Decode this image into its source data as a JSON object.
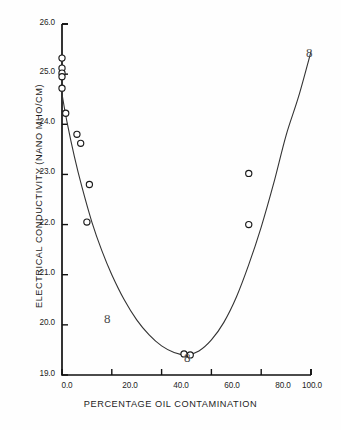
{
  "chart_data": {
    "type": "scatter",
    "title": "",
    "xlabel": "PERCENTAGE OIL CONTAMINATION",
    "ylabel": "ELECTRICAL CONDUCTIVITY (NANO MHO/CM)",
    "xlim": [
      0.0,
      100.0
    ],
    "ylim": [
      19.0,
      26.0
    ],
    "grid": false,
    "legend": null,
    "xticks": [
      0.0,
      20.0,
      40.0,
      60.0,
      80.0,
      100.0
    ],
    "xtick_labels": [
      "0.0",
      "20.0",
      "40.0",
      "60.0",
      "80.0",
      "100.0"
    ],
    "yticks": [
      19.0,
      20.0,
      21.0,
      22.0,
      23.0,
      24.0,
      25.0,
      26.0
    ],
    "ytick_labels": [
      "19.0",
      "20.0",
      "21.0",
      "22.0",
      "23.0",
      "24.0",
      "25.0",
      "26.0"
    ],
    "marker": "open-circle",
    "points": [
      {
        "x": 0.0,
        "y": 25.32
      },
      {
        "x": 0.0,
        "y": 25.12
      },
      {
        "x": 0.0,
        "y": 25.02
      },
      {
        "x": 0.0,
        "y": 24.95
      },
      {
        "x": 0.0,
        "y": 24.72
      },
      {
        "x": 1.5,
        "y": 24.22
      },
      {
        "x": 6.0,
        "y": 23.8
      },
      {
        "x": 7.5,
        "y": 23.62
      },
      {
        "x": 11.0,
        "y": 22.8
      },
      {
        "x": 10.0,
        "y": 22.05
      },
      {
        "x": 49.0,
        "y": 19.42
      },
      {
        "x": 51.5,
        "y": 19.4
      },
      {
        "x": 75.0,
        "y": 23.02
      },
      {
        "x": 75.0,
        "y": 22.0
      }
    ],
    "series": [
      {
        "name": "fitted curve",
        "type": "line",
        "x": [
          0.0,
          2.0,
          5.0,
          8.0,
          12.0,
          16.0,
          20.0,
          25.0,
          30.0,
          35.0,
          40.0,
          45.0,
          50.0,
          55.0,
          60.0,
          65.0,
          70.0,
          75.0,
          80.0,
          85.0,
          90.0,
          95.0,
          100.0
        ],
        "y": [
          24.6,
          24.05,
          23.35,
          22.75,
          22.05,
          21.48,
          21.0,
          20.5,
          20.1,
          19.8,
          19.58,
          19.45,
          19.4,
          19.48,
          19.7,
          20.05,
          20.55,
          21.2,
          21.95,
          22.82,
          23.78,
          24.55,
          25.45
        ]
      }
    ],
    "annotations": [
      {
        "text": "8",
        "x": 22.0,
        "y": 20.02
      },
      {
        "text": "8",
        "x": 51.0,
        "y": 19.3
      },
      {
        "text": "8",
        "x": 92.0,
        "y": 25.1
      }
    ]
  }
}
